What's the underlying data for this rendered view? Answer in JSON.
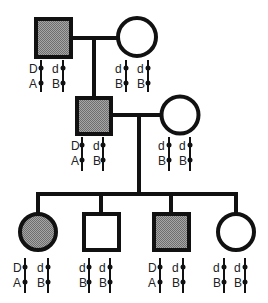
{
  "diagram": {
    "type": "pedigree",
    "colors": {
      "line": "#111111",
      "affected_fill": "#8c8c8c",
      "unaffected_fill": "#ffffff"
    },
    "generations": [
      {
        "id": "I",
        "individuals": [
          {
            "id": "I-1",
            "sex": "male",
            "affected": true,
            "chromosomes": [
              {
                "top": "D",
                "bottom": "A"
              },
              {
                "top": "d",
                "bottom": "B"
              }
            ]
          },
          {
            "id": "I-2",
            "sex": "female",
            "affected": false,
            "chromosomes": [
              {
                "top": "d",
                "bottom": "B"
              },
              {
                "top": "d",
                "bottom": "B"
              }
            ]
          }
        ]
      },
      {
        "id": "II",
        "individuals": [
          {
            "id": "II-1",
            "sex": "male",
            "affected": true,
            "chromosomes": [
              {
                "top": "D",
                "bottom": "A"
              },
              {
                "top": "d",
                "bottom": "B"
              }
            ]
          },
          {
            "id": "II-2",
            "sex": "female",
            "affected": false,
            "chromosomes": [
              {
                "top": "d",
                "bottom": "B"
              },
              {
                "top": "d",
                "bottom": "B"
              }
            ]
          }
        ]
      },
      {
        "id": "III",
        "individuals": [
          {
            "id": "III-1",
            "sex": "female",
            "affected": true,
            "chromosomes": [
              {
                "top": "D",
                "bottom": "A"
              },
              {
                "top": "d",
                "bottom": "B"
              }
            ]
          },
          {
            "id": "III-2",
            "sex": "male",
            "affected": false,
            "chromosomes": [
              {
                "top": "d",
                "bottom": "B"
              },
              {
                "top": "d",
                "bottom": "B"
              }
            ]
          },
          {
            "id": "III-3",
            "sex": "male",
            "affected": true,
            "chromosomes": [
              {
                "top": "D",
                "bottom": "A"
              },
              {
                "top": "d",
                "bottom": "B"
              }
            ]
          },
          {
            "id": "III-4",
            "sex": "female",
            "affected": false,
            "chromosomes": [
              {
                "top": "d",
                "bottom": "B"
              },
              {
                "top": "d",
                "bottom": "B"
              }
            ]
          }
        ]
      }
    ]
  }
}
